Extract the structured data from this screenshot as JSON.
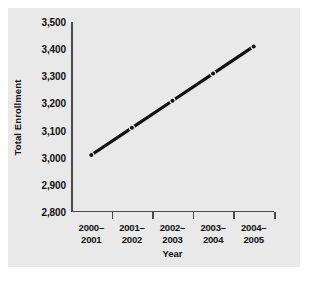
{
  "chart_data": {
    "type": "line",
    "title": "",
    "xlabel": "Year",
    "ylabel": "Total Enrollment",
    "categories": [
      "2000–2001",
      "2001–2002",
      "2002–2003",
      "2003–2004",
      "2004–2005"
    ],
    "category_lines": [
      [
        "2000–",
        "2001"
      ],
      [
        "2001–",
        "2002"
      ],
      [
        "2002–",
        "2003"
      ],
      [
        "2003–",
        "2004"
      ],
      [
        "2004–",
        "2005"
      ]
    ],
    "values": [
      3010,
      3110,
      3210,
      3310,
      3410
    ],
    "ylim": [
      2800,
      3500
    ],
    "yticks": [
      2800,
      2900,
      3000,
      3100,
      3200,
      3300,
      3400,
      3500
    ],
    "ytick_labels": [
      "2,800",
      "2,900",
      "3,000",
      "3,100",
      "3,200",
      "3,300",
      "3,400",
      "3,500"
    ],
    "grid": false,
    "legend": false,
    "marker": "circle",
    "line_color": "#111111",
    "marker_color": "#111111",
    "axis_color": "#4a4a4a",
    "panel_color": "#e9e9e9",
    "page_color": "#ffffff",
    "text_color": "#111111"
  }
}
